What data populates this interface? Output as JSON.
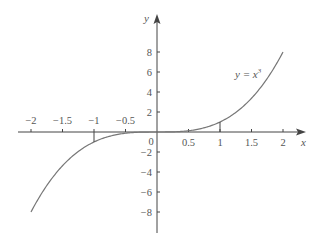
{
  "chart_data": {
    "type": "line",
    "title": "",
    "xlabel": "x",
    "ylabel": "y",
    "xlim": [
      -2,
      2
    ],
    "ylim": [
      -8,
      8
    ],
    "grid": false,
    "legend": null,
    "annotations": [
      {
        "text": "y = x³",
        "x": 1.5,
        "y": 6
      }
    ],
    "x_ticks": [
      -2,
      -1.5,
      -1,
      -0.5,
      0,
      0.5,
      1,
      1.5,
      2
    ],
    "x_tick_labels": [
      "−2",
      "−1.5",
      "−1",
      "−0.5",
      "0",
      "0.5",
      "1",
      "1.5",
      "2"
    ],
    "y_ticks": [
      8,
      6,
      4,
      2,
      -2,
      -4,
      -6,
      -8
    ],
    "y_tick_labels": [
      "8",
      "6",
      "4",
      "2",
      "−2",
      "−4",
      "−6",
      "−8"
    ],
    "series": [
      {
        "name": "y = x^3",
        "x": [
          -2,
          -1.5,
          -1,
          -0.5,
          0,
          0.5,
          1,
          1.5,
          2
        ],
        "y": [
          -8,
          -3.375,
          -1,
          -0.125,
          0,
          0.125,
          1,
          3.375,
          8
        ]
      }
    ],
    "markers": [
      {
        "x": -1,
        "y": -1,
        "type": "vertical-drop-line"
      },
      {
        "x": 1,
        "y": 1,
        "type": "vertical-drop-line"
      }
    ]
  },
  "colors": {
    "axis": "#444444",
    "curve": "#777777",
    "text": "#555555"
  }
}
